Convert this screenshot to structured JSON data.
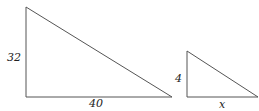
{
  "diagram": {
    "type": "similar-triangles",
    "triangles": [
      {
        "name": "large",
        "vertices": [
          [
            26,
            7
          ],
          [
            26,
            97
          ],
          [
            172,
            97
          ]
        ],
        "labels": {
          "height": "32",
          "base": "40"
        }
      },
      {
        "name": "small",
        "vertices": [
          [
            187,
            51
          ],
          [
            187,
            97
          ],
          [
            258,
            97
          ]
        ],
        "labels": {
          "height": "4",
          "base": "x"
        }
      }
    ],
    "stroke_color": "#555555"
  }
}
